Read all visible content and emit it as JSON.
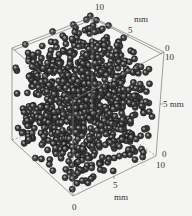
{
  "figure": {
    "type": "3d-particle-packing",
    "units": "mm",
    "particle_color": "#3a3a3a",
    "highlight_color": "#9a9a9a",
    "frame_color": "#777777",
    "background": "#f4f4f2"
  },
  "axes": {
    "top_axis": {
      "ticks": [
        "10",
        "5",
        "0"
      ],
      "unit_label": "mm"
    },
    "right_vertical_axis": {
      "ticks": [
        "10",
        "5",
        "0"
      ],
      "unit_label": "mm"
    },
    "bottom_axis": {
      "ticks": [
        "10",
        "5",
        "0"
      ],
      "unit_label": "mm"
    }
  },
  "labels": {
    "top_10": "10",
    "top_mm": "mm",
    "top_5": "5",
    "top_right_0": "0",
    "right_10": "10",
    "right_5_mm": "5  mm",
    "right_bottom_0": "0",
    "bottom_right_10": "10",
    "bottom_5": "5",
    "bottom_mm": "mm",
    "bottom_0": "0"
  }
}
